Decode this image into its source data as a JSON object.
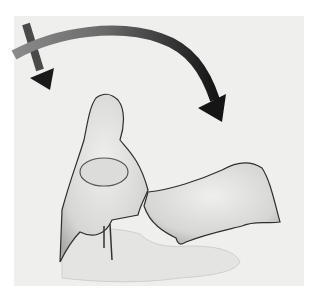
{
  "image": {
    "description": "Grayscale anatomical illustration of two articulating bones with curved motion arrows",
    "background_color": "#ffffff",
    "panel_color": "#efefed",
    "arrow_color": "#1a1a1a",
    "bone_fill": "#e2e2e0",
    "bone_outline": "#333333",
    "shadow_color": "#d8d8d6",
    "elements": [
      {
        "type": "arrow",
        "name": "short-down-arrow",
        "direction": "down"
      },
      {
        "type": "arrow",
        "name": "arc-arrow",
        "direction": "clockwise-down-right"
      },
      {
        "type": "shape",
        "name": "left-bone"
      },
      {
        "type": "shape",
        "name": "right-bone"
      },
      {
        "type": "shape",
        "name": "soft-tissue-shadow"
      }
    ]
  }
}
